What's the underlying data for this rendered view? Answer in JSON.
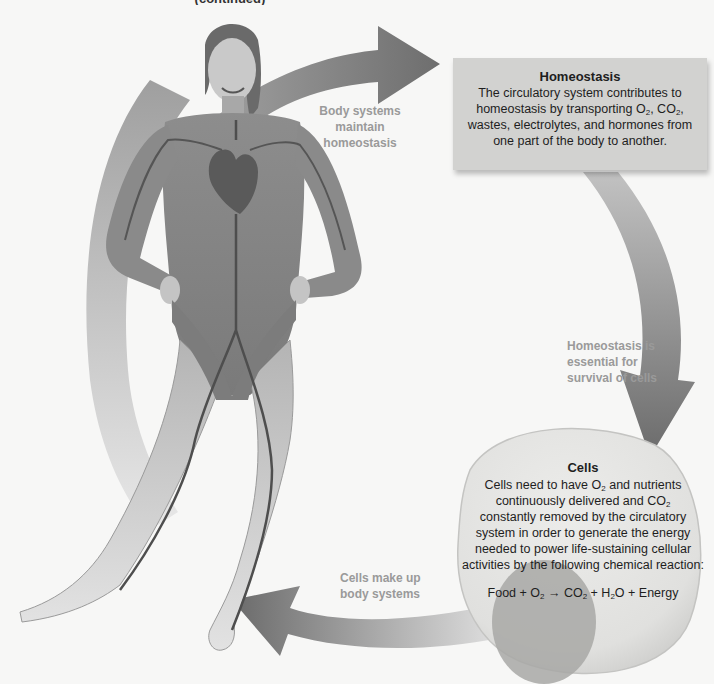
{
  "figure": {
    "top_caption_fragment": "(continued)",
    "colors": {
      "background": "#f7f7f6",
      "arrow_dark": "#6b6b6b",
      "arrow_light": "#c8c8c8",
      "box_fill": "#d2d2d0",
      "cell_fill": "#e4e4e2",
      "nucleus_fill": "#a8a8a6",
      "label_gray": "#9a9a9a",
      "text_dark": "#1e1e1e"
    }
  },
  "arrows": {
    "body_to_homeostasis": {
      "label_line1": "Body systems",
      "label_line2": "maintain homeostasis"
    },
    "homeostasis_to_cells": {
      "label_line1": "Homeostasis is",
      "label_line2": "essential for",
      "label_line3": "survival of cells"
    },
    "cells_to_body": {
      "label_line1": "Cells make up",
      "label_line2": "body systems"
    }
  },
  "homeostasis_box": {
    "title": "Homeostasis",
    "line1": "The circulatory system contributes to",
    "line2_prefix": "homeostasis by transporting O",
    "line2_sub1": "2",
    "line2_mid": ", CO",
    "line2_sub2": "2",
    "line2_suffix": ",",
    "line3": "wastes, electrolytes, and hormones from",
    "line4": "one part of the body to another."
  },
  "cells_box": {
    "title": "Cells",
    "line1_prefix": "Cells need to have O",
    "line1_sub": "2",
    "line1_suffix": " and nutrients",
    "line2_prefix": "continuously delivered and CO",
    "line2_sub": "2",
    "line3": "constantly removed by the circulatory",
    "line4": "system in order to generate the energy",
    "line5": "needed to power life-sustaining cellular",
    "line6": "activities by the following chemical reaction:",
    "equation": {
      "t1": "Food + O",
      "s1": "2",
      "t2": " → CO",
      "s2": "2",
      "t3": " + H",
      "s3": "2",
      "t4": "O + Energy"
    }
  },
  "illustration": {
    "subject": "Female figure showing the circulatory system (heart, arteries and veins)"
  }
}
